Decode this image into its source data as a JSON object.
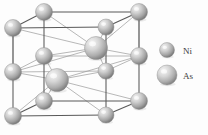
{
  "figure": {
    "background_color": "#fdfdfd",
    "bond_color": "#6b6b6b",
    "bond_color_light": "#9a9a9a"
  },
  "legend": {
    "items": [
      {
        "symbol": "Ni",
        "label": "Ni",
        "radius": 7.5,
        "cx": 167,
        "cy": 50,
        "color_light": "#f0f0f0",
        "color_mid": "#b9b9b9",
        "color_dark": "#7d7d7d",
        "label_x": 183,
        "label_y": 54
      },
      {
        "symbol": "As",
        "label": "As",
        "radius": 10,
        "cx": 167,
        "cy": 75,
        "color_light": "#f2f2f2",
        "color_mid": "#c2c2c2",
        "color_dark": "#848484",
        "label_x": 183,
        "label_y": 79
      }
    ]
  },
  "structure": {
    "atoms": [
      {
        "id": "ni-top-back-left",
        "element": "Ni",
        "cx": 13,
        "cy": 28,
        "r": 8.5
      },
      {
        "id": "ni-top-back-right",
        "element": "Ni",
        "cx": 106,
        "cy": 27,
        "r": 8.0
      },
      {
        "id": "ni-top-front-left",
        "element": "Ni",
        "cx": 44,
        "cy": 12,
        "r": 8.5
      },
      {
        "id": "ni-top-front-right",
        "element": "Ni",
        "cx": 139,
        "cy": 12,
        "r": 8.5
      },
      {
        "id": "ni-mid-back-left",
        "element": "Ni",
        "cx": 13,
        "cy": 72,
        "r": 8.5
      },
      {
        "id": "ni-mid-back-right",
        "element": "Ni",
        "cx": 106,
        "cy": 71,
        "r": 8.0
      },
      {
        "id": "ni-mid-front-left",
        "element": "Ni",
        "cx": 44,
        "cy": 56,
        "r": 8.5
      },
      {
        "id": "ni-mid-front-right",
        "element": "Ni",
        "cx": 139,
        "cy": 56,
        "r": 8.5
      },
      {
        "id": "ni-bot-back-left",
        "element": "Ni",
        "cx": 13,
        "cy": 116,
        "r": 8.5
      },
      {
        "id": "ni-bot-back-right",
        "element": "Ni",
        "cx": 106,
        "cy": 115,
        "r": 8.0
      },
      {
        "id": "ni-bot-front-left",
        "element": "Ni",
        "cx": 44,
        "cy": 101,
        "r": 8.5
      },
      {
        "id": "ni-bot-front-right",
        "element": "Ni",
        "cx": 139,
        "cy": 101,
        "r": 8.5
      },
      {
        "id": "as-upper-center",
        "element": "As",
        "cx": 96,
        "cy": 48,
        "r": 11.5
      },
      {
        "id": "as-lower-center",
        "element": "As",
        "cx": 57,
        "cy": 80,
        "r": 11.5
      }
    ],
    "bonds_dark": [
      {
        "x1": 13,
        "y1": 28,
        "x2": 44,
        "y2": 12
      },
      {
        "x1": 44,
        "y1": 12,
        "x2": 139,
        "y2": 12
      },
      {
        "x1": 106,
        "y1": 27,
        "x2": 139,
        "y2": 12
      },
      {
        "x1": 13,
        "y1": 28,
        "x2": 106,
        "y2": 27
      },
      {
        "x1": 13,
        "y1": 116,
        "x2": 44,
        "y2": 101
      },
      {
        "x1": 44,
        "y1": 101,
        "x2": 139,
        "y2": 101
      },
      {
        "x1": 106,
        "y1": 115,
        "x2": 139,
        "y2": 101
      },
      {
        "x1": 13,
        "y1": 116,
        "x2": 106,
        "y2": 115
      },
      {
        "x1": 13,
        "y1": 28,
        "x2": 13,
        "y2": 116
      },
      {
        "x1": 44,
        "y1": 12,
        "x2": 44,
        "y2": 101
      },
      {
        "x1": 139,
        "y1": 12,
        "x2": 139,
        "y2": 101
      },
      {
        "x1": 106,
        "y1": 27,
        "x2": 106,
        "y2": 115
      }
    ],
    "bonds_light": [
      {
        "x1": 13,
        "y1": 72,
        "x2": 44,
        "y2": 56
      },
      {
        "x1": 44,
        "y1": 56,
        "x2": 139,
        "y2": 56
      },
      {
        "x1": 106,
        "y1": 71,
        "x2": 139,
        "y2": 56
      },
      {
        "x1": 13,
        "y1": 72,
        "x2": 106,
        "y2": 71
      },
      {
        "x1": 96,
        "y1": 48,
        "x2": 44,
        "y2": 12
      },
      {
        "x1": 96,
        "y1": 48,
        "x2": 139,
        "y2": 12
      },
      {
        "x1": 96,
        "y1": 48,
        "x2": 106,
        "y2": 27
      },
      {
        "x1": 96,
        "y1": 48,
        "x2": 13,
        "y2": 28
      },
      {
        "x1": 96,
        "y1": 48,
        "x2": 44,
        "y2": 56
      },
      {
        "x1": 96,
        "y1": 48,
        "x2": 139,
        "y2": 56
      },
      {
        "x1": 96,
        "y1": 48,
        "x2": 106,
        "y2": 71
      },
      {
        "x1": 96,
        "y1": 48,
        "x2": 13,
        "y2": 72
      },
      {
        "x1": 57,
        "y1": 80,
        "x2": 44,
        "y2": 56
      },
      {
        "x1": 57,
        "y1": 80,
        "x2": 139,
        "y2": 56
      },
      {
        "x1": 57,
        "y1": 80,
        "x2": 106,
        "y2": 71
      },
      {
        "x1": 57,
        "y1": 80,
        "x2": 13,
        "y2": 72
      },
      {
        "x1": 57,
        "y1": 80,
        "x2": 44,
        "y2": 101
      },
      {
        "x1": 57,
        "y1": 80,
        "x2": 139,
        "y2": 101
      },
      {
        "x1": 57,
        "y1": 80,
        "x2": 106,
        "y2": 115
      },
      {
        "x1": 57,
        "y1": 80,
        "x2": 13,
        "y2": 116
      },
      {
        "x1": 13,
        "y1": 72,
        "x2": 13,
        "y2": 28
      },
      {
        "x1": 139,
        "y1": 56,
        "x2": 139,
        "y2": 12
      }
    ]
  }
}
